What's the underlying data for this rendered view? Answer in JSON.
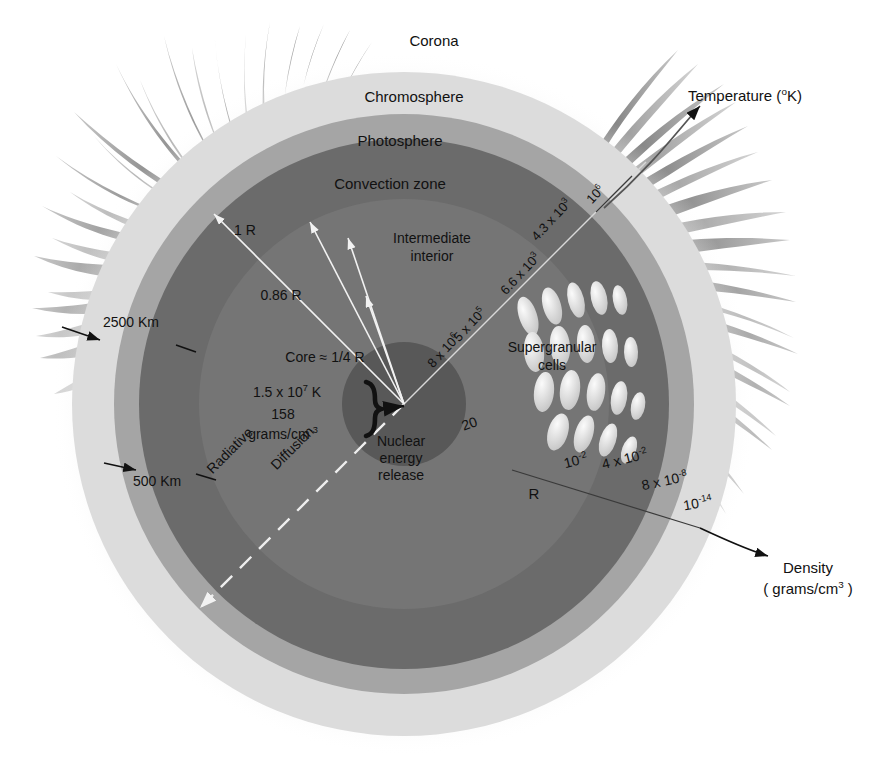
{
  "diagram": {
    "type": "cross-section",
    "center": {
      "x": 404,
      "y": 404
    }
  },
  "layers": [
    {
      "name": "corona",
      "label": "Corona",
      "radius": 0,
      "color": "#ffffff"
    },
    {
      "name": "chromosphere",
      "label": "Chromosphere",
      "radius": 332,
      "color": "#e0e0e0"
    },
    {
      "name": "photosphere",
      "label": "Photosphere",
      "radius": 290,
      "color": "#a8a8a8"
    },
    {
      "name": "convection-zone",
      "label": "Convection zone",
      "radius": 265,
      "color": "#6e6e6e"
    },
    {
      "name": "intermediate-interior",
      "label": "Intermediate interior",
      "radius": 205,
      "color": "#777777"
    },
    {
      "name": "core",
      "label": "Core",
      "radius": 62,
      "color": "#5c5c5c"
    }
  ],
  "labels": {
    "corona": "Corona",
    "chromosphere": "Chromosphere",
    "photosphere": "Photosphere",
    "convection_zone": "Convection zone",
    "intermediate_interior_line1": "Intermediate",
    "intermediate_interior_line2": "interior",
    "supergranular_line1": "Supergranular",
    "supergranular_line2": "cells",
    "nuclear_line1": "Nuclear",
    "nuclear_line2": "energy",
    "nuclear_line3": "release",
    "radiative": "Radiative",
    "diffusion": "Diffusion",
    "radius_outer": "1 R",
    "radius_086": "0.86 R",
    "core_radius": "Core ≈ 1/4 R",
    "r_marker": "R"
  },
  "core_values": {
    "temperature": "1.5 x 10",
    "temperature_exp": "7",
    "temperature_unit": " K",
    "density": "158",
    "density_unit": "grams/cm",
    "density_unit_exp": "-3"
  },
  "thickness_callouts": [
    {
      "name": "chromosphere-thickness",
      "value": "2500 Km"
    },
    {
      "name": "photosphere-thickness",
      "value": "500 Km"
    }
  ],
  "temperature_axis": {
    "label": "Temperature (",
    "label_deg": "o",
    "label_end": "K)",
    "unit": "K",
    "values": [
      {
        "text": "8 x 10",
        "exp": "6",
        "value": 8000000
      },
      {
        "text": "5 x 10",
        "exp": "5",
        "value": 500000
      },
      {
        "text": "6.6 x 10",
        "exp": "3",
        "value": 6600
      },
      {
        "text": "4.3 x 10",
        "exp": "3",
        "value": 4300
      },
      {
        "text": "10",
        "exp": "6",
        "value": 1000000
      }
    ]
  },
  "density_axis": {
    "label_line1": "Density",
    "label_line2": "( grams/cm",
    "label_line2_exp": "3",
    "label_line2_end": " )",
    "values": [
      {
        "text": "20",
        "exp": "",
        "value": 20
      },
      {
        "text": "10",
        "exp": "-2",
        "value": 0.01
      },
      {
        "text": "4 x 10",
        "exp": "-2",
        "value": 0.04
      },
      {
        "text": "8 x 10",
        "exp": "-8",
        "value": 8e-08
      },
      {
        "text": "10",
        "exp": "-14",
        "value": 1e-14
      }
    ]
  },
  "colors": {
    "corona_halo": "#ededed",
    "chromosphere": "#dcdcdc",
    "photosphere": "#a5a5a5",
    "convection": "#6b6b6b",
    "intermediate": "#757575",
    "core": "#585858",
    "streamer_dark": "#6f6f6f",
    "streamer_light": "#b4b4b4",
    "granule": "#e8e8e8",
    "text": "#111111"
  }
}
